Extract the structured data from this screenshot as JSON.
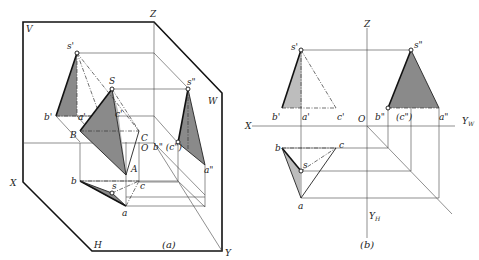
{
  "figure_a": {
    "caption": "(a)",
    "planes": {
      "v": "V",
      "w": "W",
      "h": "H"
    },
    "axes": {
      "x": "X",
      "y": "Y",
      "z": "Z",
      "origin": "O"
    },
    "space_points": {
      "s": "S",
      "a": "A",
      "b": "B",
      "c": "C"
    },
    "v_projection": {
      "s": "s'",
      "a": "a'",
      "b": "b'",
      "c": "c'"
    },
    "w_projection": {
      "s": "s\"",
      "a": "a\"",
      "bc": "b\" (c\")"
    },
    "h_projection": {
      "s": "s",
      "a": "a",
      "b": "b",
      "c": "c"
    }
  },
  "figure_b": {
    "caption": "(b)",
    "axes": {
      "x": "X",
      "z": "Z",
      "origin": "O",
      "yw": "Y",
      "yw_sub": "W",
      "yh": "Y",
      "yh_sub": "H"
    },
    "v_projection": {
      "s": "s'",
      "a": "a'",
      "b": "b'",
      "c": "c'"
    },
    "w_projection": {
      "s": "s\"",
      "a": "a\"",
      "b": "b\"",
      "c": "(c\")"
    },
    "h_projection": {
      "s": "s",
      "a": "a",
      "b": "b",
      "c": "c"
    }
  }
}
